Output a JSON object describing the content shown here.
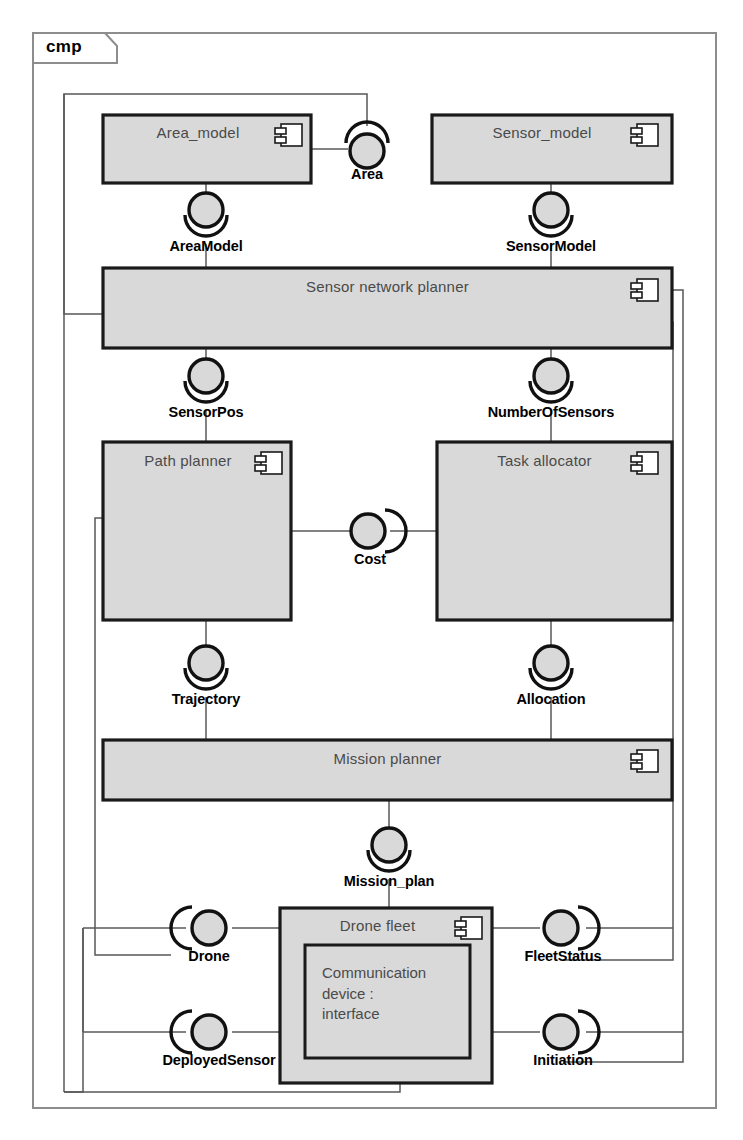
{
  "diagram": {
    "kind": "UML Component Diagram",
    "frame_tag": "cmp",
    "colors": {
      "component_fill": "#d9d9d9",
      "component_stroke": "#1a1a1a",
      "connector_stroke": "#555555",
      "frame_stroke": "#8a8a8a",
      "title_text": "#4a4a4a",
      "label_text": "#000000",
      "page_background": "#ffffff",
      "ball_fill": "#d9d9d9"
    },
    "components": [
      {
        "id": "area_model",
        "label": "Area_model",
        "x": 103,
        "y": 115,
        "w": 208,
        "h": 68,
        "title_align": "center"
      },
      {
        "id": "sensor_model",
        "label": "Sensor_model",
        "x": 432,
        "y": 115,
        "w": 240,
        "h": 68,
        "title_align": "center"
      },
      {
        "id": "snp",
        "label": "Sensor network planner",
        "x": 103,
        "y": 268,
        "w": 569,
        "h": 80,
        "title_align": "center"
      },
      {
        "id": "path_planner",
        "label": "Path planner",
        "x": 103,
        "y": 442,
        "w": 188,
        "h": 178,
        "title_align": "center"
      },
      {
        "id": "task_alloc",
        "label": "Task allocator",
        "x": 437,
        "y": 442,
        "w": 235,
        "h": 178,
        "title_align": "center"
      },
      {
        "id": "mission_plan",
        "label": "Mission planner",
        "x": 103,
        "y": 740,
        "w": 569,
        "h": 60,
        "title_align": "center"
      },
      {
        "id": "drone_fleet",
        "label": "Drone fleet",
        "x": 280,
        "y": 908,
        "w": 212,
        "h": 175,
        "title_align": "center"
      }
    ],
    "inner_part": {
      "id": "comm_device",
      "label": "Communication\ndevice :\ninterface",
      "x": 305,
      "y": 945,
      "w": 165,
      "h": 113
    },
    "interfaces": [
      {
        "id": "area",
        "label": "Area",
        "cx": 367,
        "cy": 146,
        "socket": "top",
        "label_x": 367,
        "label_y": 166
      },
      {
        "id": "areamodel",
        "label": "AreaModel",
        "cx": 206,
        "cy": 212,
        "socket": "bottom",
        "label_x": 206,
        "label_y": 238
      },
      {
        "id": "sensormodel",
        "label": "SensorModel",
        "cx": 551,
        "cy": 212,
        "socket": "bottom",
        "label_x": 551,
        "label_y": 238
      },
      {
        "id": "sensorpos",
        "label": "SensorPos",
        "cx": 206,
        "cy": 378,
        "socket": "bottom",
        "label_x": 206,
        "label_y": 404
      },
      {
        "id": "numberofsensors",
        "label": "NumberOfSensors",
        "cx": 551,
        "cy": 378,
        "socket": "bottom",
        "label_x": 551,
        "label_y": 404
      },
      {
        "id": "cost",
        "label": "Cost",
        "cx": 370,
        "cy": 531,
        "socket": "right",
        "label_x": 370,
        "label_y": 551
      },
      {
        "id": "trajectory",
        "label": "Trajectory",
        "cx": 206,
        "cy": 665,
        "socket": "bottom",
        "label_x": 206,
        "label_y": 691
      },
      {
        "id": "allocation",
        "label": "Allocation",
        "cx": 551,
        "cy": 665,
        "socket": "bottom",
        "label_x": 551,
        "label_y": 691
      },
      {
        "id": "mission_plan_if",
        "label": "Mission_plan",
        "cx": 389,
        "cy": 847,
        "socket": "bottom",
        "label_x": 389,
        "label_y": 873
      },
      {
        "id": "drone",
        "label": "Drone",
        "cx": 209,
        "cy": 928,
        "socket": "left",
        "label_x": 209,
        "label_y": 948
      },
      {
        "id": "fleetstatus",
        "label": "FleetStatus",
        "cx": 563,
        "cy": 928,
        "socket": "right",
        "label_x": 563,
        "label_y": 948
      },
      {
        "id": "deployedsensor",
        "label": "DeployedSensor",
        "cx": 209,
        "cy": 1032,
        "socket": "left",
        "label_x": 209,
        "label_y": 1052
      },
      {
        "id": "initiation",
        "label": "Initiation",
        "cx": 563,
        "cy": 1032,
        "socket": "right",
        "label_x": 563,
        "label_y": 1052
      }
    ],
    "frame": {
      "x": 33,
      "y": 33,
      "w": 683,
      "h": 1075,
      "tag_w": 72,
      "tag_h": 30,
      "tag_label_x": 46,
      "tag_label_y": 47
    }
  }
}
